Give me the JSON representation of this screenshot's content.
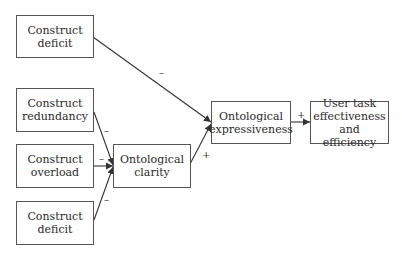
{
  "nodes": {
    "construct_deficit_top": {
      "line1": "Construct",
      "line2": "deficit"
    },
    "construct_redundancy": {
      "line1": "Construct",
      "line2": "redundancy"
    },
    "construct_overload": {
      "line1": "Construct",
      "line2": "overload"
    },
    "construct_deficit_bottom": {
      "line1": "Construct",
      "line2": "deficit"
    },
    "ontological_clarity": {
      "line1": "Ontological",
      "line2": "clarity"
    },
    "ontological_expressiveness": {
      "line1": "Ontological",
      "line2": "expressiveness"
    },
    "user_task": {
      "line1": "User task",
      "line2": "effectiveness",
      "line3": "and efficiency"
    }
  },
  "edges": [
    {
      "from": "construct_deficit_top",
      "to": "ontological_expressiveness",
      "sign": "–"
    },
    {
      "from": "construct_redundancy",
      "to": "ontological_clarity",
      "sign": "–"
    },
    {
      "from": "construct_overload",
      "to": "ontological_clarity",
      "sign": "–"
    },
    {
      "from": "construct_deficit_bottom",
      "to": "ontological_clarity",
      "sign": "–"
    },
    {
      "from": "ontological_clarity",
      "to": "ontological_expressiveness",
      "sign": "+"
    },
    {
      "from": "ontological_expressiveness",
      "to": "user_task",
      "sign": "+"
    }
  ]
}
